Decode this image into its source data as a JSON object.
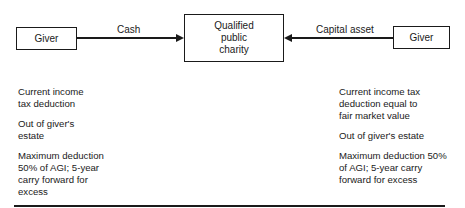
{
  "diagram": {
    "nodes": {
      "giver_left": {
        "label": "Giver"
      },
      "charity": {
        "lines": [
          "Qualified",
          "public",
          "charity"
        ]
      },
      "giver_right": {
        "label": "Giver"
      }
    },
    "edges": {
      "cash": {
        "label": "Cash",
        "from": "giver_left",
        "to": "charity"
      },
      "capital_asset": {
        "label": "Capital asset",
        "from": "giver_right",
        "to": "charity"
      }
    },
    "notes_left": [
      "Current income\ntax deduction",
      "Out of giver's\nestate",
      "Maximum deduction\n50% of AGI; 5-year\ncarry forward for\nexcess"
    ],
    "notes_right": [
      "Current income tax\ndeduction equal to\nfair market value",
      "Out of giver's estate",
      "Maximum deduction 50%\nof AGI; 5-year carry\nforward for excess"
    ]
  }
}
